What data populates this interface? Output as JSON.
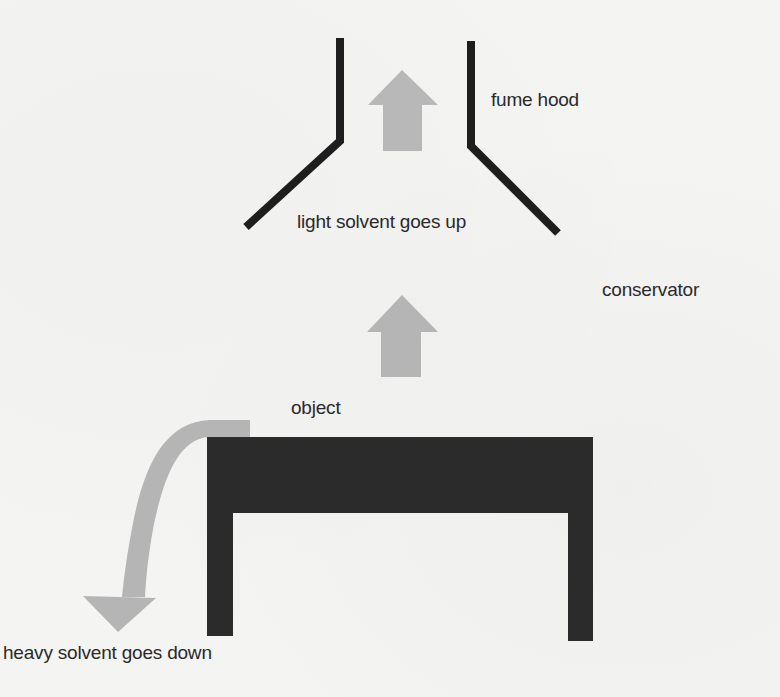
{
  "diagram": {
    "labels": {
      "fume_hood": "fume hood",
      "light_solvent": "light solvent goes up",
      "conservator": "conservator",
      "object": "object",
      "heavy_solvent": "heavy solvent goes down"
    },
    "icons": {
      "upper_arrow": "arrow-up-icon",
      "middle_arrow": "arrow-up-icon",
      "curved_arrow": "curved-arrow-down-icon"
    },
    "colors": {
      "background": "#f4f4f3",
      "ink": "#1e1e1e",
      "object_fill": "#2b2b2b",
      "arrow_fill": "#b5b5b5",
      "text": "#2a2a2a"
    }
  }
}
